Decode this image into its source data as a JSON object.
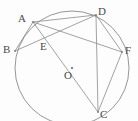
{
  "figure": {
    "kind": "circle-geometry-diagram",
    "width": 138,
    "height": 121,
    "background_color": "#fdfdfd",
    "stroke_color": "#808080",
    "label_color": "#4a4a4a",
    "stroke_width": 0.8
  },
  "circle": {
    "center_label": "O",
    "cx": 72,
    "cy": 68,
    "r": 57
  },
  "points": [
    {
      "id": "A",
      "label": "A",
      "x": 33,
      "y": 22,
      "label_x": 18,
      "label_y": 13,
      "on_circle": true
    },
    {
      "id": "B",
      "label": "B",
      "x": 15,
      "y": 51,
      "label_x": 3,
      "label_y": 44,
      "on_circle": true
    },
    {
      "id": "C",
      "label": "C",
      "x": 98,
      "y": 112,
      "label_x": 100,
      "label_y": 109,
      "on_circle": true
    },
    {
      "id": "D",
      "label": "D",
      "x": 96,
      "y": 15,
      "label_x": 98,
      "label_y": 6,
      "on_circle": true
    },
    {
      "id": "E",
      "label": "E",
      "x": 47,
      "y": 38,
      "label_x": 40,
      "label_y": 41,
      "on_circle": false
    },
    {
      "id": "F",
      "label": "F",
      "x": 122,
      "y": 52,
      "label_x": 125,
      "label_y": 45,
      "on_circle": true
    },
    {
      "id": "O",
      "label": "O",
      "x": 72,
      "y": 68,
      "label_x": 64,
      "label_y": 70,
      "on_circle": false
    }
  ],
  "segments": [
    {
      "from": "A",
      "to": "D",
      "name": "chord-ad"
    },
    {
      "from": "A",
      "to": "F",
      "name": "chord-af"
    },
    {
      "from": "A",
      "to": "C",
      "name": "chord-ac"
    },
    {
      "from": "A",
      "to": "B",
      "name": "chord-ab"
    },
    {
      "from": "B",
      "to": "D",
      "name": "chord-bd"
    },
    {
      "from": "D",
      "to": "F",
      "name": "chord-df"
    },
    {
      "from": "D",
      "to": "C",
      "name": "chord-dc"
    },
    {
      "from": "F",
      "to": "C",
      "name": "chord-fc"
    }
  ],
  "intersections": [
    {
      "point": "E",
      "of": [
        "chord-ac",
        "chord-bd"
      ]
    }
  ]
}
